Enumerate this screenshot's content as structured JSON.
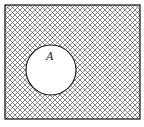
{
  "diagram": {
    "type": "venn",
    "universal_set": {
      "shape": "rectangle",
      "shaded": true,
      "pattern": "cross-hatch"
    },
    "sets": [
      {
        "label": "A",
        "shape": "circle",
        "shaded": false
      }
    ],
    "colors": {
      "stroke": "#222222",
      "hatch": "#555555",
      "background": "#ffffff"
    }
  }
}
